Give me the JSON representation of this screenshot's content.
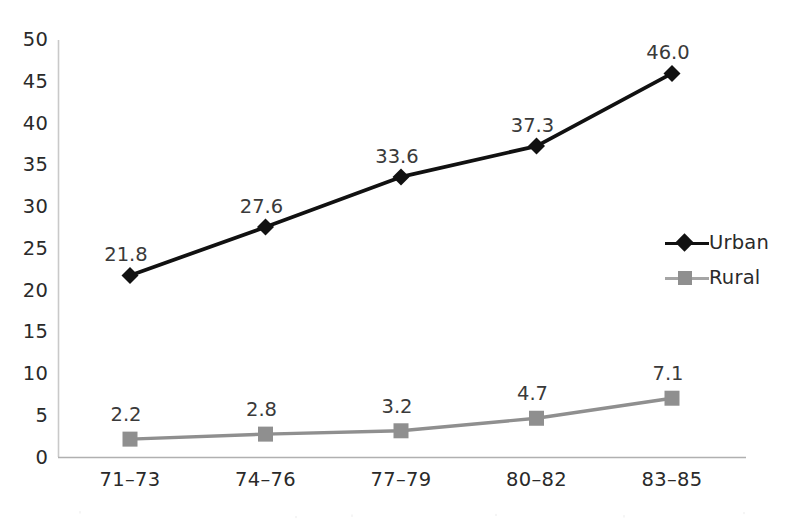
{
  "chart_data": {
    "type": "line",
    "title": "",
    "subtitle": "",
    "xlabel": "",
    "ylabel": "",
    "categories": [
      "71–73",
      "74–76",
      "77–79",
      "80–82",
      "83–85"
    ],
    "series": [
      {
        "name": "Urban",
        "values": [
          21.8,
          27.6,
          33.6,
          37.3,
          46.0
        ],
        "labels": [
          "21.8",
          "27.6",
          "33.6",
          "37.3",
          "46.0"
        ],
        "color": "#111111",
        "marker": "diamond"
      },
      {
        "name": "Rural",
        "values": [
          2.2,
          2.8,
          3.2,
          4.7,
          7.1
        ],
        "labels": [
          "2.2",
          "2.8",
          "3.2",
          "4.7",
          "7.1"
        ],
        "color": "#8f8f8f",
        "marker": "square"
      }
    ],
    "ylim": [
      0,
      50
    ],
    "ytick_step": 5,
    "ytick_labels": [
      "50",
      "45",
      "40",
      "35",
      "30",
      "25",
      "20",
      "15",
      "10",
      "5",
      "0"
    ],
    "grid": false,
    "legend_position": "right",
    "data_labels_shown": true
  },
  "axes": {
    "y_axis_color": "#c9c9c9",
    "x_axis_color": "#b0b0b0"
  },
  "legend": {
    "entries": [
      {
        "label": "Urban",
        "color": "#111111",
        "marker": "diamond"
      },
      {
        "label": "Rural",
        "color": "#8f8f8f",
        "marker": "square"
      }
    ]
  }
}
